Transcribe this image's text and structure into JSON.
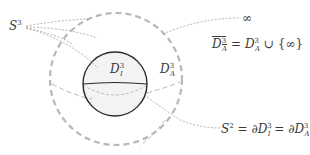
{
  "diagram": {
    "title": "",
    "labels": {
      "s3": {
        "base": "S",
        "sup": "3"
      },
      "infinity": "∞",
      "d_inner": {
        "base": "D",
        "sup": "3",
        "sub": "I"
      },
      "d_outer": {
        "base": "D",
        "sup": "3",
        "sub": "A"
      },
      "closure_eq": {
        "lhs_base": "D",
        "lhs_sup": "3",
        "lhs_sub": "A",
        "eq": "=",
        "rhs_base": "D",
        "rhs_sup": "3",
        "rhs_sub": "A",
        "union": "∪",
        "set": "{∞}"
      },
      "boundary_eq": {
        "s_base": "S",
        "s_sup": "2",
        "eq1": "=",
        "partial1": "∂D",
        "p1_sup": "3",
        "p1_sub": "I",
        "eq2": "=",
        "partial2": "∂D",
        "p2_sup": "3",
        "p2_sub": "A"
      }
    },
    "shapes": {
      "outer_sphere": {
        "style": "dashed",
        "color": "#b4b4b4",
        "cx": 116,
        "cy": 79,
        "r": 66
      },
      "inner_ball": {
        "style": "solid",
        "color": "#2a2a2a",
        "fill": "#f4f4f4",
        "cx": 115,
        "cy": 84,
        "r": 32
      },
      "leader_color": "#9a9a9a"
    }
  }
}
